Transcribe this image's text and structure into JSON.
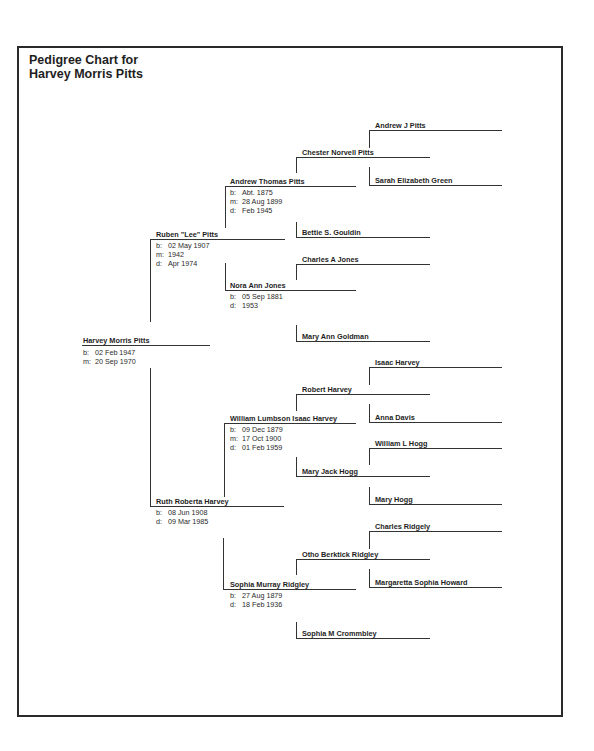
{
  "title": {
    "line1": "Pedigree Chart for",
    "line2": "Harvey Morris Pitts"
  },
  "people": {
    "p1": {
      "name": "Harvey Morris Pitts",
      "facts": [
        {
          "k": "b:",
          "v": "02 Feb 1947"
        },
        {
          "k": "m:",
          "v": "20 Sep 1970"
        }
      ]
    },
    "p2": {
      "name": "Ruben \"Lee\" Pitts",
      "facts": [
        {
          "k": "b:",
          "v": "02 May 1907"
        },
        {
          "k": "m:",
          "v": "1942"
        },
        {
          "k": "d:",
          "v": "Apr 1974"
        }
      ]
    },
    "p3": {
      "name": "Ruth Roberta Harvey",
      "facts": [
        {
          "k": "b:",
          "v": "08 Jun 1908"
        },
        {
          "k": "d:",
          "v": "09 Mar 1985"
        }
      ]
    },
    "p4": {
      "name": "Andrew Thomas Pitts",
      "facts": [
        {
          "k": "b:",
          "v": "Abt. 1875"
        },
        {
          "k": "m:",
          "v": "28 Aug 1899"
        },
        {
          "k": "d:",
          "v": "Feb 1945"
        }
      ]
    },
    "p5": {
      "name": "Nora Ann Jones",
      "facts": [
        {
          "k": "b:",
          "v": "05 Sep 1881"
        },
        {
          "k": "d:",
          "v": "1953"
        }
      ]
    },
    "p6": {
      "name": "William Lumbson Isaac Harvey",
      "facts": [
        {
          "k": "b:",
          "v": "09 Dec 1879"
        },
        {
          "k": "m:",
          "v": "17 Oct 1900"
        },
        {
          "k": "d:",
          "v": "01 Feb 1959"
        }
      ]
    },
    "p7": {
      "name": "Sophia Murray Ridgley",
      "facts": [
        {
          "k": "b:",
          "v": "27 Aug 1879"
        },
        {
          "k": "d:",
          "v": "18 Feb 1936"
        }
      ]
    },
    "p8": {
      "name": "Chester Norvell Pitts"
    },
    "p9": {
      "name": "Bettie S. Gouldin"
    },
    "p10": {
      "name": "Charles A Jones"
    },
    "p11": {
      "name": "Mary Ann Goldman"
    },
    "p12": {
      "name": "Robert Harvey"
    },
    "p13": {
      "name": "Mary Jack Hogg"
    },
    "p14": {
      "name": "Otho Berktick Ridgley"
    },
    "p15": {
      "name": "Sophia M Crommbley"
    },
    "p16": {
      "name": "Andrew J Pitts"
    },
    "p17": {
      "name": "Sarah Elizabeth Green"
    },
    "p24": {
      "name": "Isaac Harvey"
    },
    "p25": {
      "name": "Anna Davis"
    },
    "p26": {
      "name": "William L Hogg"
    },
    "p27": {
      "name": "Mary Hogg"
    },
    "p28": {
      "name": "Charles Ridgely"
    },
    "p29": {
      "name": "Margaretta Sophia Howard"
    }
  }
}
